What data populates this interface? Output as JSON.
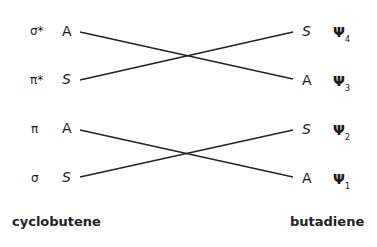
{
  "left": {
    "title": "cyclobutene",
    "rows": [
      {
        "orbital": "σ*",
        "symmetry": "A"
      },
      {
        "orbital": "π*",
        "symmetry": "S"
      },
      {
        "orbital": "π",
        "symmetry": "A"
      },
      {
        "orbital": "σ",
        "symmetry": "S"
      }
    ]
  },
  "right": {
    "title": "butadiene",
    "rows": [
      {
        "symmetry": "S",
        "psi": "Ψ",
        "index": "4"
      },
      {
        "symmetry": "A",
        "psi": "Ψ",
        "index": "3"
      },
      {
        "symmetry": "S",
        "psi": "Ψ",
        "index": "2"
      },
      {
        "symmetry": "A",
        "psi": "Ψ",
        "index": "1"
      }
    ]
  },
  "correlations": [
    {
      "from": "σ* A",
      "to": "A Ψ3"
    },
    {
      "from": "π* S",
      "to": "S Ψ4"
    },
    {
      "from": "π A",
      "to": "A Ψ1"
    },
    {
      "from": "σ S",
      "to": "S Ψ2"
    }
  ]
}
